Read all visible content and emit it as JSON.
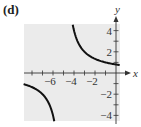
{
  "panel_label": "(d)",
  "chart_data": {
    "type": "line",
    "title": "",
    "xlabel": "x",
    "ylabel": "y",
    "function": "y = 4/(x+5)",
    "vertical_asymptote": -5,
    "horizontal_asymptote": 0,
    "xlim": [
      -8.8,
      0.4
    ],
    "ylim": [
      -4.6,
      4.6
    ],
    "x_tick_labels": [
      "-6",
      "-4",
      "-2"
    ],
    "y_tick_labels": [
      "4",
      "2",
      "-2",
      "-4"
    ],
    "x_ticks": [
      -8,
      -7,
      -6,
      -5,
      -4,
      -3,
      -2,
      -1
    ],
    "y_ticks": [
      -4,
      -3,
      -2,
      -1,
      1,
      2,
      3,
      4
    ],
    "series": [
      {
        "name": "right branch",
        "x": [
          -4.1,
          -4,
          -3,
          -2,
          -1,
          0
        ],
        "y": [
          4.44,
          4,
          2,
          1.33,
          1,
          0.8
        ]
      },
      {
        "name": "left branch",
        "x": [
          -8.8,
          -8,
          -7,
          -6
        ],
        "y": [
          -1.05,
          -1.33,
          -2,
          -4
        ]
      }
    ],
    "grid": false,
    "background": "#ebebeb"
  }
}
